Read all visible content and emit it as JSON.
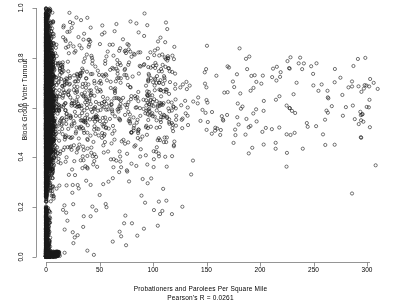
{
  "chart_data": {
    "type": "scatter",
    "title": "",
    "xlabel": "Probationers and Parolees Per Square Mile",
    "ylabel": "Block Group Voter Turnout",
    "annotation": "Pearson's R = 0.0261",
    "pearson_r": 0.0261,
    "xlim": [
      0,
      310
    ],
    "ylim": [
      0,
      1
    ],
    "xticks": [
      0,
      50,
      100,
      150,
      200,
      250,
      300
    ],
    "yticks": [
      0.0,
      0.2,
      0.4,
      0.6,
      0.8,
      1.0
    ],
    "xticklabels": [
      "0",
      "50",
      "100",
      "150",
      "200",
      "250",
      "300"
    ],
    "yticklabels": [
      "0.0",
      "0.2",
      "0.4",
      "0.6",
      "0.8",
      "1.0"
    ],
    "grid": false,
    "legend": null,
    "n_points": 4200,
    "marker": {
      "shape": "circle-open",
      "radius_px": 1.6,
      "stroke": "#1a1a1a",
      "stroke_width": 0.6,
      "fill": "none"
    },
    "axis_color": "#7a7a7a",
    "background": "#ffffff",
    "distribution": {
      "dense_column_x_range": [
        0,
        6
      ],
      "dense_column_y_range": [
        0.0,
        1.0
      ],
      "low_turnout_cluster_y_range": [
        0.0,
        0.2
      ],
      "tail_x_range": [
        6,
        310
      ],
      "tail_y_center": 0.62
    },
    "outliers": [
      {
        "x": 270,
        "y": 0.755
      },
      {
        "x": 286,
        "y": 0.705
      },
      {
        "x": 302,
        "y": 0.685
      },
      {
        "x": 310,
        "y": 0.675
      },
      {
        "x": 286,
        "y": 0.255
      },
      {
        "x": 261,
        "y": 0.45
      },
      {
        "x": 240,
        "y": 0.435
      },
      {
        "x": 218,
        "y": 0.52
      },
      {
        "x": 190,
        "y": 0.805
      }
    ]
  }
}
